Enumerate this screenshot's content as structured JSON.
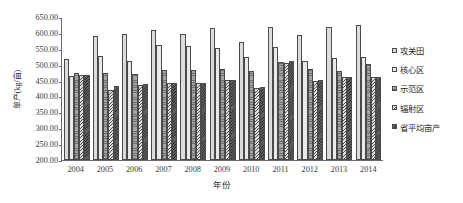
{
  "chart_data": {
    "type": "bar",
    "title": "",
    "xlabel": "年份",
    "ylabel": "单产(kg/亩)",
    "ylim": [
      200,
      650
    ],
    "ytick_step": 50,
    "yticks": [
      "650.00",
      "600.00",
      "550.00",
      "500.00",
      "450.00",
      "400.00",
      "350.00",
      "300.00",
      "250.00",
      "200.00"
    ],
    "ytick_values": [
      650,
      600,
      550,
      500,
      450,
      400,
      350,
      300,
      250,
      200
    ],
    "categories": [
      "2004",
      "2005",
      "2006",
      "2007",
      "2008",
      "2009",
      "2010",
      "2011",
      "2012",
      "2013",
      "2014"
    ],
    "grid": false,
    "legend_position": "right",
    "series": [
      {
        "name": "攻关田",
        "pattern": "solid-light",
        "values": [
          518,
          590,
          597,
          610,
          597,
          617,
          571,
          618,
          594,
          620,
          624
        ]
      },
      {
        "name": "核心区",
        "pattern": "dotted",
        "values": [
          463,
          528,
          512,
          563,
          559,
          554,
          524,
          555,
          513,
          522,
          524
        ]
      },
      {
        "name": "示范区",
        "pattern": "horizontal-lines",
        "values": [
          474,
          473,
          472,
          484,
          482,
          487,
          481,
          508,
          486,
          479,
          503
        ]
      },
      {
        "name": "辐射区",
        "pattern": "diagonal-hatch-light",
        "values": [
          469,
          420,
          437,
          442,
          441,
          451,
          428,
          504,
          449,
          461,
          461
        ]
      },
      {
        "name": "省平均亩产",
        "pattern": "diagonal-hatch-dark",
        "values": [
          468,
          433,
          438,
          443,
          443,
          453,
          430,
          511,
          451,
          462,
          462
        ]
      }
    ]
  }
}
